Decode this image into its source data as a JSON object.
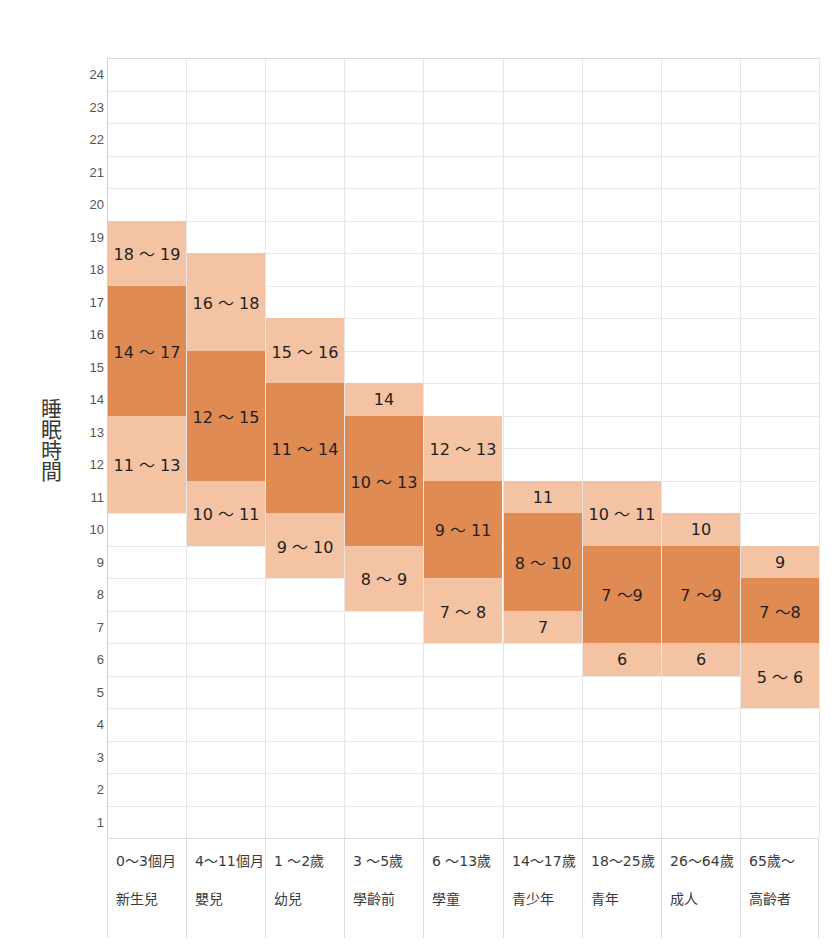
{
  "axis": {
    "y_title": "睡眠時間",
    "y_ticks": [
      24,
      23,
      22,
      21,
      20,
      19,
      18,
      17,
      16,
      15,
      14,
      13,
      12,
      11,
      10,
      9,
      8,
      7,
      6,
      5,
      4,
      3,
      2,
      1
    ],
    "y_min": 0.5,
    "y_max": 24.5
  },
  "colors": {
    "band_light": "#f4c3a4",
    "band_dark": "#e08b54",
    "grid": "#e9e9e9",
    "text": "#1f1f1f"
  },
  "chart_data": {
    "type": "bar",
    "title": "",
    "xlabel": "",
    "ylabel": "睡眠時間",
    "ylim": [
      0.5,
      24.5
    ],
    "grid": true,
    "legend": "none",
    "categories": [
      "0〜3個月",
      "4〜11個月",
      "1 〜2歲",
      "3 〜5歲",
      "6 〜13歲",
      "14〜17歲",
      "18〜25歲",
      "26〜64歲",
      "65歲〜"
    ],
    "category_groups": [
      "新生兒",
      "嬰兒",
      "幼兒",
      "學齡前",
      "學童",
      "青少年",
      "青年",
      "成人",
      "高齡者"
    ],
    "series": [
      {
        "name": "0〜3個月",
        "upper_band": {
          "label": "18 〜 19",
          "from": 17.5,
          "to": 19.5
        },
        "core_band": {
          "label": "14 〜 17",
          "from": 13.5,
          "to": 17.5
        },
        "lower_band": {
          "label": "11 〜 13",
          "from": 10.5,
          "to": 13.5
        }
      },
      {
        "name": "4〜11個月",
        "upper_band": {
          "label": "16 〜 18",
          "from": 15.5,
          "to": 18.5
        },
        "core_band": {
          "label": "12 〜 15",
          "from": 11.5,
          "to": 15.5
        },
        "lower_band": {
          "label": "10 〜 11",
          "from": 9.5,
          "to": 11.5
        }
      },
      {
        "name": "1 〜2歲",
        "upper_band": {
          "label": "15 〜 16",
          "from": 14.5,
          "to": 16.5
        },
        "core_band": {
          "label": "11 〜 14",
          "from": 10.5,
          "to": 14.5
        },
        "lower_band": {
          "label": "9 〜 10",
          "from": 8.5,
          "to": 10.5
        }
      },
      {
        "name": "3 〜5歲",
        "upper_band": {
          "label": "14",
          "from": 13.5,
          "to": 14.5
        },
        "core_band": {
          "label": "10 〜 13",
          "from": 9.5,
          "to": 13.5
        },
        "lower_band": {
          "label": "8 〜 9",
          "from": 7.5,
          "to": 9.5
        }
      },
      {
        "name": "6 〜13歲",
        "upper_band": {
          "label": "12 〜 13",
          "from": 11.5,
          "to": 13.5
        },
        "core_band": {
          "label": "9 〜 11",
          "from": 8.5,
          "to": 11.5
        },
        "lower_band": {
          "label": "7 〜 8",
          "from": 6.5,
          "to": 8.5
        }
      },
      {
        "name": "14〜17歲",
        "upper_band": {
          "label": "11",
          "from": 10.5,
          "to": 11.5
        },
        "core_band": {
          "label": "8 〜 10",
          "from": 7.5,
          "to": 10.5
        },
        "lower_band": {
          "label": "7",
          "from": 6.5,
          "to": 7.5
        }
      },
      {
        "name": "18〜25歲",
        "upper_band": {
          "label": "10 〜 11",
          "from": 9.5,
          "to": 11.5
        },
        "core_band": {
          "label": "7 〜9",
          "from": 6.5,
          "to": 9.5
        },
        "lower_band": {
          "label": "6",
          "from": 5.5,
          "to": 6.5
        }
      },
      {
        "name": "26〜64歲",
        "upper_band": {
          "label": "10",
          "from": 9.5,
          "to": 10.5
        },
        "core_band": {
          "label": "7 〜9",
          "from": 6.5,
          "to": 9.5
        },
        "lower_band": {
          "label": "6",
          "from": 5.5,
          "to": 6.5
        }
      },
      {
        "name": "65歲〜",
        "upper_band": {
          "label": "9",
          "from": 8.5,
          "to": 9.5
        },
        "core_band": {
          "label": "7 〜8",
          "from": 6.5,
          "to": 8.5
        },
        "lower_band": {
          "label": "5 〜 6",
          "from": 4.5,
          "to": 6.5
        }
      }
    ]
  }
}
